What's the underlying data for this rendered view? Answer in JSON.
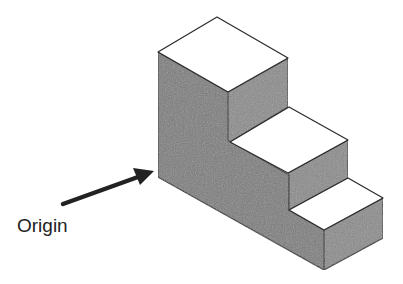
{
  "diagram": {
    "type": "isometric-staircase-block",
    "steps": 3,
    "colors": {
      "top_face": "#ffffff",
      "side_face": "#7a7a7a",
      "front_face": "#888888",
      "edge": "#2a2a2a",
      "arrow": "#222222"
    },
    "annotation": {
      "label": "Origin",
      "points_to": "bottom-left back corner of the block"
    }
  }
}
